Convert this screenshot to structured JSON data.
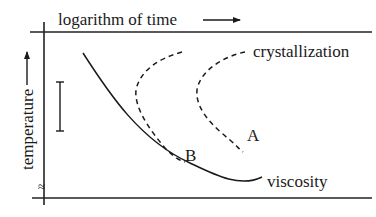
{
  "diagram": {
    "x_axis_label": "logarithm of time",
    "y_axis_label": "temperature",
    "axis_break_symbol": "≈",
    "curves": {
      "crystallization_label": "crystallization",
      "viscosity_label": "viscosity",
      "point_a_label": "A",
      "point_b_label": "B"
    },
    "colors": {
      "line": "#1a1a1a",
      "background": "#ffffff"
    }
  }
}
